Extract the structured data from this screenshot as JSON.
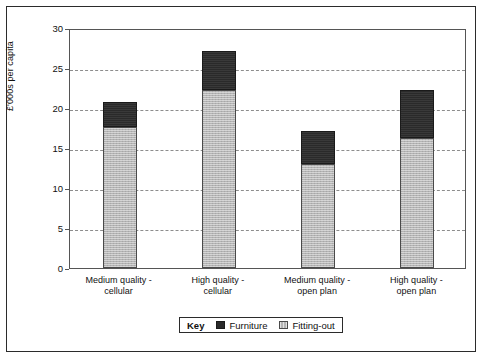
{
  "chart_data": {
    "type": "bar",
    "stacked": true,
    "title": "",
    "xlabel": "",
    "ylabel": "£'000s per capita",
    "ylim": [
      0,
      30
    ],
    "yticks": [
      0,
      5,
      10,
      15,
      20,
      25,
      30
    ],
    "grid": true,
    "categories": [
      "Medium quality - cellular",
      "High quality - cellular",
      "Medium quality - open plan",
      "High quality - open plan"
    ],
    "category_lines": [
      [
        "Medium quality -",
        "cellular"
      ],
      [
        "High quality -",
        "cellular"
      ],
      [
        "Medium quality -",
        "open plan"
      ],
      [
        "High quality -",
        "open plan"
      ]
    ],
    "series": [
      {
        "name": "Fitting-out",
        "color": "#b4b4b4",
        "values": [
          17.6,
          22.3,
          13.0,
          16.3
        ]
      },
      {
        "name": "Furniture",
        "color": "#2a2a2a",
        "values": [
          3.2,
          4.8,
          4.1,
          6.0
        ]
      }
    ],
    "totals": [
      20.8,
      27.1,
      17.1,
      22.3
    ],
    "legend": {
      "position": "bottom",
      "key_label": "Key",
      "entries": [
        {
          "label": "Furniture",
          "swatch": "furniture"
        },
        {
          "label": "Fitting-out",
          "swatch": "fitting"
        }
      ]
    }
  }
}
